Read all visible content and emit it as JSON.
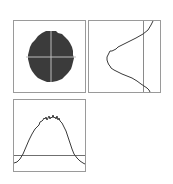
{
  "figure": {
    "panels": [
      {
        "name": "beam-image",
        "description": "dark circular spot with crosshair",
        "spot_color": "#3b3b3b",
        "crosshair_color": "#bdbdbd"
      },
      {
        "name": "vertical-profile",
        "description": "vertical intensity profile with reference line"
      },
      {
        "name": "horizontal-profile",
        "description": "horizontal intensity profile with baseline"
      }
    ],
    "colors": {
      "frame": "#9a9a9a",
      "curve": "#3a3a3a",
      "reference_line": "#6f6f6f"
    }
  }
}
